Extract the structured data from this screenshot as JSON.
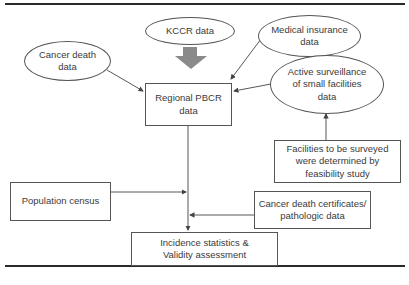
{
  "diagram": {
    "type": "flowchart",
    "nodes": {
      "kccr": {
        "label": "KCCR data",
        "shape": "ellipse"
      },
      "cancer_death": {
        "label": "Cancer death\ndata",
        "shape": "ellipse"
      },
      "medical_insurance": {
        "label": "Medical insurance\ndata",
        "shape": "ellipse"
      },
      "regional_pbcr": {
        "label": "Regional PBCR\ndata",
        "shape": "box"
      },
      "active_surveillance": {
        "label": "Active surveillance\nof small facilities\ndata",
        "shape": "ellipse"
      },
      "facilities": {
        "label": "Facilities to be surveyed\nwere determined by\nfeasibility study",
        "shape": "box"
      },
      "population_census": {
        "label": "Population census",
        "shape": "box"
      },
      "death_certificates": {
        "label": "Cancer death certificates/\npathologic data",
        "shape": "box"
      },
      "incidence": {
        "label": "Incidence statistics &\nValidity assessment",
        "shape": "box"
      }
    },
    "edges": [
      {
        "from": "kccr",
        "to": "regional_pbcr",
        "style": "thick-gray-arrow"
      },
      {
        "from": "cancer_death",
        "to": "regional_pbcr"
      },
      {
        "from": "medical_insurance",
        "to": "regional_pbcr"
      },
      {
        "from": "active_surveillance",
        "to": "regional_pbcr"
      },
      {
        "from": "facilities",
        "to": "active_surveillance"
      },
      {
        "from": "regional_pbcr",
        "to": "incidence"
      },
      {
        "from": "population_census",
        "to": "incidence"
      },
      {
        "from": "death_certificates",
        "to": "incidence"
      }
    ],
    "colors": {
      "line": "#444444",
      "thick_arrow": "#8a8a8a",
      "border": "#555555"
    }
  }
}
